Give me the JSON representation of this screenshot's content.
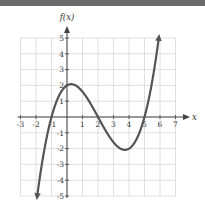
{
  "chart_data": {
    "type": "line",
    "title": "",
    "xlabel": "x",
    "ylabel": "f(x)",
    "xlim": [
      -3,
      7
    ],
    "ylim": [
      -5,
      5
    ],
    "grid": true,
    "x_ticks": [
      -3,
      -2,
      -1,
      1,
      2,
      3,
      4,
      5,
      6,
      7
    ],
    "y_ticks": [
      5,
      4,
      3,
      2,
      1,
      -1,
      -2,
      -3,
      -4,
      -5
    ],
    "function": "f(x) = 0.2(x+1)(x-2)(x-5)",
    "series": [
      {
        "name": "f(x)",
        "x": [
          -2,
          -1.5,
          -1,
          -0.5,
          0,
          0.5,
          1,
          1.5,
          2,
          2.5,
          3,
          3.5,
          4,
          4.5,
          5,
          5.5,
          6
        ],
        "y": [
          -5.6,
          -2.86,
          0,
          1.35,
          2.0,
          2.03,
          1.6,
          0.86,
          0,
          -0.79,
          -1.6,
          -1.9,
          -2.0,
          -1.6,
          0,
          1.94,
          5.6
        ]
      }
    ],
    "annotations": {
      "zeros": [
        -1,
        2,
        5
      ],
      "local_max": [
        0.5,
        2.03
      ],
      "local_min": [
        3.7,
        -2.08
      ],
      "end_behavior": "arrows at both ends"
    }
  },
  "labels": {
    "x_axis": "x",
    "y_axis": "f(x)",
    "x_tick_labels": [
      "-3",
      "-2",
      "-1",
      "1",
      "2",
      "3",
      "4",
      "5",
      "6",
      "7"
    ],
    "y_tick_labels": [
      "5",
      "4",
      "3",
      "2",
      "1",
      "-1",
      "-2",
      "-3",
      "-4",
      "-5"
    ]
  },
  "colors": {
    "topbar": "#6b6b6b",
    "grid": "#d8d8d8",
    "axis": "#444444",
    "curve": "#555555"
  }
}
